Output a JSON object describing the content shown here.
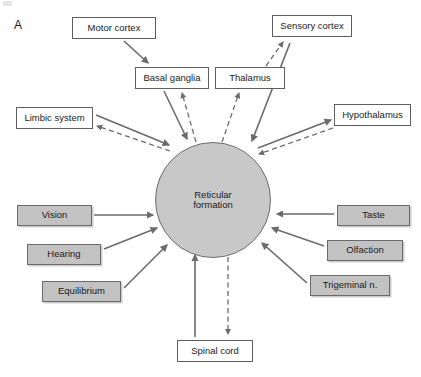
{
  "figure": {
    "panel_label": "A",
    "width": 421,
    "height": 377,
    "colors": {
      "shaded_box_fill": "#c2c2c2",
      "hub_fill": "#c8c8c8",
      "box_stroke": "#5e5e5e",
      "arrow_stroke": "#6b6b6b",
      "text": "#1a1a1a",
      "background": "#ffffff"
    }
  },
  "hub": {
    "name": "reticular-formation",
    "label_line1": "Reticular",
    "label_line2": "formation",
    "shape": "circle",
    "cx": 213,
    "cy": 200,
    "r": 58
  },
  "nodes": [
    {
      "id": "motor-cortex",
      "label": "Motor cortex",
      "style": "white",
      "x": 72,
      "y": 17,
      "w": 84,
      "h": 22
    },
    {
      "id": "sensory-cortex",
      "label": "Sensory cortex",
      "style": "white",
      "x": 272,
      "y": 15,
      "w": 80,
      "h": 22
    },
    {
      "id": "basal-ganglia",
      "label": "Basal ganglia",
      "style": "white",
      "x": 135,
      "y": 67,
      "w": 74,
      "h": 22
    },
    {
      "id": "thalamus",
      "label": "Thalamus",
      "style": "white",
      "x": 215,
      "y": 67,
      "w": 70,
      "h": 22
    },
    {
      "id": "limbic-system",
      "label": "Limbic system",
      "style": "white",
      "x": 16,
      "y": 107,
      "w": 77,
      "h": 22
    },
    {
      "id": "hypothalamus",
      "label": "Hypothalamus",
      "style": "white",
      "x": 334,
      "y": 104,
      "w": 77,
      "h": 22
    },
    {
      "id": "vision",
      "label": "Vision",
      "style": "shaded",
      "x": 17,
      "y": 205,
      "w": 75,
      "h": 21
    },
    {
      "id": "hearing",
      "label": "Hearing",
      "style": "shaded",
      "x": 27,
      "y": 244,
      "w": 74,
      "h": 21
    },
    {
      "id": "equilibrium",
      "label": "Equilibrium",
      "style": "shaded",
      "x": 42,
      "y": 281,
      "w": 79,
      "h": 21
    },
    {
      "id": "taste",
      "label": "Taste",
      "style": "shaded",
      "x": 337,
      "y": 205,
      "w": 73,
      "h": 21
    },
    {
      "id": "olfaction",
      "label": "Olfaction",
      "style": "shaded",
      "x": 327,
      "y": 240,
      "w": 76,
      "h": 21
    },
    {
      "id": "trigeminal-n",
      "label": "Trigeminal n.",
      "style": "shaded",
      "x": 310,
      "y": 275,
      "w": 80,
      "h": 21
    },
    {
      "id": "spinal-cord",
      "label": "Spinal cord",
      "style": "white",
      "x": 177,
      "y": 340,
      "w": 76,
      "h": 22
    }
  ],
  "connections": [
    {
      "id": "motor-cortex-to-basal-ganglia",
      "from": "motor-cortex",
      "to": "basal-ganglia",
      "line": "solid",
      "x1": 124,
      "y1": 41,
      "x2": 148,
      "y2": 63
    },
    {
      "id": "basal-ganglia-to-hub",
      "from": "basal-ganglia",
      "to": "reticular-formation",
      "line": "solid",
      "x1": 164,
      "y1": 91,
      "x2": 187,
      "y2": 139
    },
    {
      "id": "hub-to-basal-ganglia",
      "from": "reticular-formation",
      "to": "basal-ganglia",
      "line": "dashed",
      "x1": 196,
      "y1": 142,
      "x2": 182,
      "y2": 93
    },
    {
      "id": "hub-to-thalamus",
      "from": "reticular-formation",
      "to": "thalamus",
      "line": "dashed",
      "x1": 222,
      "y1": 142,
      "x2": 239,
      "y2": 93
    },
    {
      "id": "thalamus-to-sensory-cortex",
      "from": "thalamus",
      "to": "sensory-cortex",
      "line": "dashed",
      "x1": 266,
      "y1": 66,
      "x2": 283,
      "y2": 42
    },
    {
      "id": "sensory-cortex-to-hub",
      "from": "sensory-cortex",
      "to": "reticular-formation",
      "line": "solid",
      "x1": 290,
      "y1": 43,
      "x2": 252,
      "y2": 141
    },
    {
      "id": "hub-to-limbic-system",
      "from": "reticular-formation",
      "to": "limbic-system",
      "line": "dashed",
      "x1": 170,
      "y1": 151,
      "x2": 97,
      "y2": 126
    },
    {
      "id": "limbic-system-to-hub",
      "from": "limbic-system",
      "to": "reticular-formation",
      "line": "solid",
      "x1": 96,
      "y1": 115,
      "x2": 169,
      "y2": 145
    },
    {
      "id": "hub-to-hypothalamus",
      "from": "reticular-formation",
      "to": "hypothalamus",
      "line": "solid",
      "x1": 258,
      "y1": 148,
      "x2": 331,
      "y2": 120
    },
    {
      "id": "hypothalamus-to-hub",
      "from": "hypothalamus",
      "to": "reticular-formation",
      "line": "dashed",
      "x1": 333,
      "y1": 128,
      "x2": 259,
      "y2": 154
    },
    {
      "id": "vision-to-hub",
      "from": "vision",
      "to": "reticular-formation",
      "line": "solid",
      "x1": 94,
      "y1": 215,
      "x2": 153,
      "y2": 215
    },
    {
      "id": "hearing-to-hub",
      "from": "hearing",
      "to": "reticular-formation",
      "line": "solid",
      "x1": 104,
      "y1": 249,
      "x2": 157,
      "y2": 228
    },
    {
      "id": "equilibrium-to-hub",
      "from": "equilibrium",
      "to": "reticular-formation",
      "line": "solid",
      "x1": 124,
      "y1": 288,
      "x2": 167,
      "y2": 245
    },
    {
      "id": "taste-to-hub",
      "from": "taste",
      "to": "reticular-formation",
      "line": "solid",
      "x1": 334,
      "y1": 214,
      "x2": 277,
      "y2": 214
    },
    {
      "id": "olfaction-to-hub",
      "from": "olfaction",
      "to": "reticular-formation",
      "line": "solid",
      "x1": 324,
      "y1": 246,
      "x2": 272,
      "y2": 228
    },
    {
      "id": "trigeminal-to-hub",
      "from": "trigeminal-n",
      "to": "reticular-formation",
      "line": "solid",
      "x1": 307,
      "y1": 283,
      "x2": 262,
      "y2": 243
    },
    {
      "id": "spinal-cord-to-hub",
      "from": "spinal-cord",
      "to": "reticular-formation",
      "line": "solid",
      "x1": 195,
      "y1": 337,
      "x2": 195,
      "y2": 255
    },
    {
      "id": "hub-to-spinal-cord",
      "from": "reticular-formation",
      "to": "spinal-cord",
      "line": "dashed",
      "x1": 228,
      "y1": 257,
      "x2": 228,
      "y2": 334
    }
  ]
}
